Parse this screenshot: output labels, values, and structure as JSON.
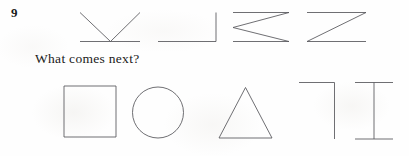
{
  "page": {
    "background_color": "#fefefe",
    "ink_color": "#55555a",
    "text_color": "#1a1a1a"
  },
  "question": {
    "number": "9",
    "prompt": "What comes next?"
  },
  "sequence": {
    "label": "pattern-sequence",
    "count": 4,
    "items": [
      {
        "id": "sequence-figure-1",
        "name": "v-with-baseline-figure",
        "description": "Two diagonal strokes meeting at bottom centre forming a V, crossed by a horizontal baseline",
        "stroke_count": 3
      },
      {
        "id": "sequence-figure-2",
        "name": "right-angle-corner-figure",
        "description": "Horizontal baseline with a vertical stroke rising at its right end, forming a mirrored L",
        "stroke_count": 2
      },
      {
        "id": "sequence-figure-3",
        "name": "greater-than-zigzag-figure",
        "description": "Top horizontal, diagonal down-left to mid, diagonal down-right, bottom horizontal - a sideways Z / greater-than sign",
        "stroke_count": 4
      },
      {
        "id": "sequence-figure-4",
        "name": "z-figure",
        "description": "Top horizontal, single diagonal from top-right to bottom-left, bottom horizontal - letter Z",
        "stroke_count": 3
      }
    ]
  },
  "options": {
    "label": "answer-options",
    "count": 5,
    "items": [
      {
        "id": "option-1",
        "name": "square-option",
        "shape": "square",
        "description": "Outlined square"
      },
      {
        "id": "option-2",
        "name": "circle-option",
        "shape": "circle",
        "description": "Outlined circle"
      },
      {
        "id": "option-3",
        "name": "triangle-option",
        "shape": "triangle",
        "description": "Outlined equilateral triangle"
      },
      {
        "id": "option-4",
        "name": "corner-bracket-option",
        "shape": "corner-bracket",
        "description": "Horizontal top stroke with a vertical stroke descending from its right end"
      },
      {
        "id": "option-5",
        "name": "i-beam-option",
        "shape": "i-beam",
        "description": "Vertical stroke capped by short horizontal strokes top and bottom, forming a serif capital I"
      }
    ]
  }
}
